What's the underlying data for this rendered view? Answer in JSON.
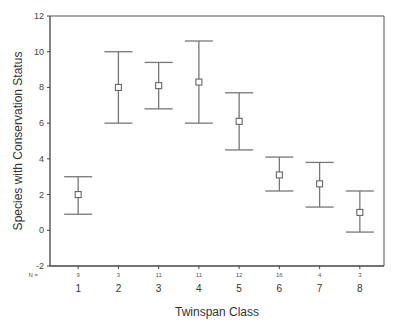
{
  "chart_data": {
    "type": "errorbar",
    "title": "",
    "xlabel": "Twinspan Class",
    "ylabel": "Species with Conservation Status",
    "ylim": [
      -2,
      12
    ],
    "yticks": [
      -2,
      0,
      2,
      4,
      6,
      8,
      10,
      12
    ],
    "grid": false,
    "legend": null,
    "n_prefix": "N =",
    "categories": [
      "1",
      "2",
      "3",
      "4",
      "5",
      "6",
      "7",
      "8"
    ],
    "n": [
      9,
      3,
      11,
      11,
      12,
      16,
      4,
      3
    ],
    "means": [
      2.0,
      8.0,
      8.1,
      8.3,
      6.1,
      3.1,
      2.6,
      1.0
    ],
    "lower": [
      0.9,
      6.0,
      6.8,
      6.0,
      4.5,
      2.2,
      1.3,
      -0.1
    ],
    "upper": [
      3.0,
      10.0,
      9.4,
      10.6,
      7.7,
      4.1,
      3.8,
      2.2
    ],
    "marker": "open-square",
    "colors": {
      "axis": "#444444",
      "bars": "#777777",
      "marker": "#666666"
    }
  }
}
